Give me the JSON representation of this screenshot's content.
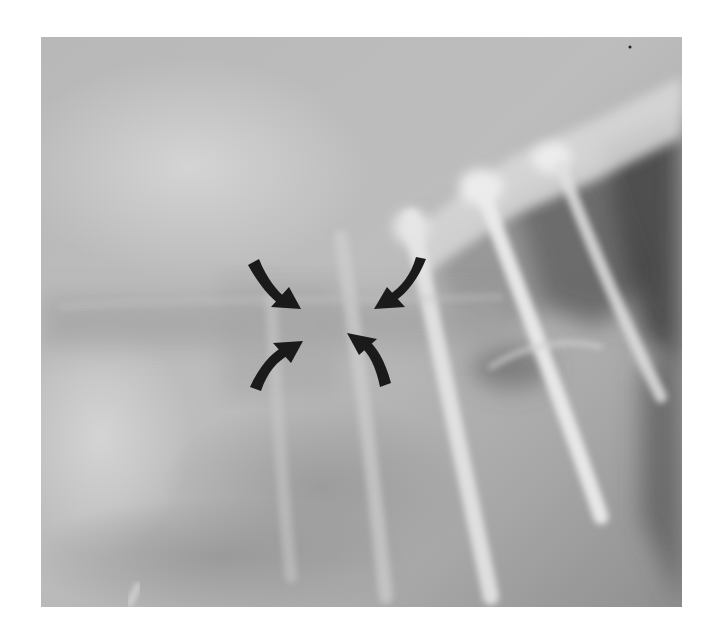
{
  "figure": {
    "type": "radiograph",
    "colors": {
      "background": "#ffffff",
      "film_base": "#b3b3b3",
      "bone": "#e6e6e6",
      "dark_air": "#4a4a4a",
      "arrow": "#1a1a1a"
    },
    "annotations": [
      {
        "name": "arrow-top-left",
        "direction": "down-right"
      },
      {
        "name": "arrow-top-right",
        "direction": "down-left"
      },
      {
        "name": "arrow-bottom-left",
        "direction": "up-right"
      },
      {
        "name": "arrow-bottom-right",
        "direction": "up-left"
      }
    ]
  }
}
